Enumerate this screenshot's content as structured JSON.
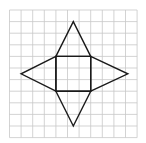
{
  "diagram": {
    "type": "net-of-square-pyramid",
    "grid": {
      "origin_x": 9.5,
      "origin_y": 10,
      "cell_size": 11.6,
      "columns": 11,
      "rows": 11,
      "line_color": "#c8c8c8"
    },
    "shape": {
      "stroke_color": "#1a1a1a",
      "square": {
        "col_start": 4,
        "row_start": 4,
        "col_end": 7,
        "row_end": 7
      },
      "apexes": {
        "top": {
          "col": 5.5,
          "row": 1
        },
        "bottom": {
          "col": 5.5,
          "row": 10
        },
        "left": {
          "col": 1,
          "row": 5.5
        },
        "right": {
          "col": 10.2,
          "row": 5.5
        }
      }
    }
  }
}
